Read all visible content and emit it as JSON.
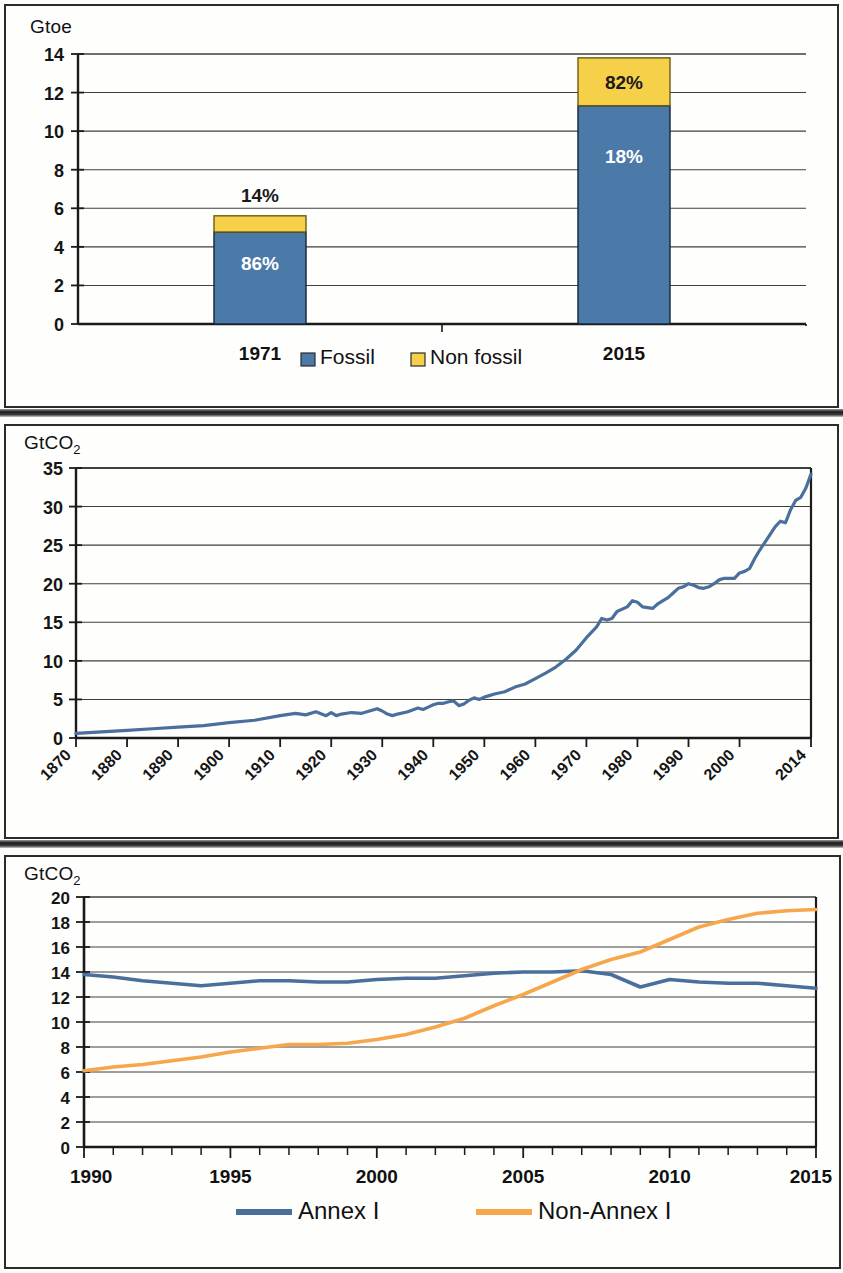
{
  "colors": {
    "fossil_blue": "#4b79a8",
    "non_fossil_yellow": "#f7d04a",
    "annex1_blue": "#4a6f9c",
    "non_annex1_orange": "#f6a64b",
    "axis": "#1a1a1a",
    "grid": "#3c3c3c",
    "panel_bg": "#fefefd",
    "panel_border": "#2b2b2b"
  },
  "panel1": {
    "unit_label": "Gtoe",
    "legend": [
      {
        "label": "Fossil",
        "color": "#4b79a8",
        "icon": "legend-swatch"
      },
      {
        "label": "Non fossil",
        "color": "#f7d04a",
        "icon": "legend-swatch"
      }
    ]
  },
  "panel2": {
    "unit_label_main": "GtCO",
    "unit_label_sub": "2"
  },
  "panel3": {
    "unit_label_main": "GtCO",
    "unit_label_sub": "2",
    "legend": [
      {
        "label": "Annex I",
        "color": "#4a6f9c",
        "icon": "legend-line"
      },
      {
        "label": "Non-Annex I",
        "color": "#f6a64b",
        "icon": "legend-line"
      }
    ]
  },
  "chart_data": [
    {
      "id": "world-primary-energy-supply",
      "type": "bar",
      "stacked": true,
      "title": "",
      "xlabel": "",
      "ylabel": "Gtoe",
      "ylim": [
        0,
        14
      ],
      "yticks": [
        0,
        2,
        4,
        6,
        8,
        10,
        12,
        14
      ],
      "grid": true,
      "legend_position": "bottom",
      "categories": [
        "1971",
        "2015"
      ],
      "series": [
        {
          "name": "Fossil",
          "color": "#4b79a8",
          "values": [
            4.77,
            11.32
          ],
          "data_labels": [
            "86%",
            "18%"
          ]
        },
        {
          "name": "Non fossil",
          "color": "#f7d04a",
          "values": [
            0.84,
            2.48
          ],
          "data_labels": [
            "14%",
            "82%"
          ]
        }
      ],
      "annotations": [
        {
          "text": "86%",
          "category": "1971",
          "series": "Fossil",
          "placement": "inside",
          "color": "#ffffff"
        },
        {
          "text": "14%",
          "category": "1971",
          "series": "Non fossil",
          "placement": "above",
          "color": "#1a1a1a"
        },
        {
          "text": "82%",
          "category": "2015",
          "series": "Fossil",
          "placement": "inside",
          "color": "#ffffff"
        },
        {
          "text": "18%",
          "category": "2015",
          "series": "Non fossil",
          "placement": "inside",
          "color": "#1a1a1a"
        }
      ],
      "totals": [
        5.61,
        13.8
      ]
    },
    {
      "id": "global-co2-emissions-1870-2014",
      "type": "line",
      "title": "",
      "xlabel": "",
      "ylabel": "GtCO2",
      "ylim": [
        0,
        35
      ],
      "yticks": [
        0,
        5,
        10,
        15,
        20,
        25,
        30,
        35
      ],
      "xlim": [
        1870,
        2014
      ],
      "xticks": [
        1870,
        1880,
        1890,
        1900,
        1910,
        1920,
        1930,
        1940,
        1950,
        1960,
        1970,
        1980,
        1990,
        2000,
        2014
      ],
      "xtick_rotation": -45,
      "grid": true,
      "legend_position": "none",
      "series": [
        {
          "name": "Global CO2 emissions",
          "color": "#4a6f9c",
          "x": [
            1870,
            1875,
            1880,
            1885,
            1890,
            1895,
            1900,
            1905,
            1910,
            1913,
            1915,
            1917,
            1919,
            1920,
            1921,
            1922,
            1924,
            1926,
            1928,
            1929,
            1930,
            1931,
            1932,
            1933,
            1935,
            1937,
            1938,
            1939,
            1940,
            1941,
            1942,
            1943,
            1944,
            1945,
            1946,
            1947,
            1948,
            1949,
            1950,
            1952,
            1954,
            1956,
            1958,
            1960,
            1962,
            1964,
            1966,
            1968,
            1970,
            1972,
            1973,
            1974,
            1975,
            1976,
            1978,
            1979,
            1980,
            1981,
            1982,
            1983,
            1984,
            1985,
            1986,
            1987,
            1988,
            1989,
            1990,
            1991,
            1992,
            1993,
            1994,
            1995,
            1996,
            1997,
            1998,
            1999,
            2000,
            2001,
            2002,
            2003,
            2004,
            2005,
            2006,
            2007,
            2008,
            2009,
            2010,
            2011,
            2012,
            2013,
            2014
          ],
          "y": [
            0.6,
            0.8,
            1.0,
            1.2,
            1.4,
            1.6,
            2.0,
            2.3,
            2.9,
            3.2,
            3.0,
            3.4,
            2.9,
            3.3,
            2.9,
            3.1,
            3.3,
            3.2,
            3.6,
            3.8,
            3.5,
            3.1,
            2.9,
            3.1,
            3.4,
            3.9,
            3.7,
            4.0,
            4.3,
            4.5,
            4.5,
            4.7,
            4.8,
            4.2,
            4.4,
            4.9,
            5.2,
            5.0,
            5.3,
            5.7,
            6.0,
            6.6,
            7.0,
            7.7,
            8.4,
            9.2,
            10.2,
            11.4,
            13.0,
            14.4,
            15.5,
            15.3,
            15.5,
            16.4,
            17.0,
            17.8,
            17.6,
            17.0,
            16.9,
            16.8,
            17.4,
            17.8,
            18.2,
            18.8,
            19.4,
            19.6,
            20.0,
            19.8,
            19.5,
            19.4,
            19.6,
            20.0,
            20.5,
            20.7,
            20.7,
            20.7,
            21.4,
            21.6,
            22.0,
            23.3,
            24.4,
            25.4,
            26.4,
            27.4,
            28.1,
            27.9,
            29.6,
            30.8,
            31.2,
            32.4,
            34.2
          ]
        }
      ]
    },
    {
      "id": "annex1-vs-non-annex1-co2",
      "type": "line",
      "title": "",
      "xlabel": "",
      "ylabel": "GtCO2",
      "ylim": [
        0,
        20
      ],
      "yticks": [
        0,
        2,
        4,
        6,
        8,
        10,
        12,
        14,
        16,
        18,
        20
      ],
      "xlim": [
        1990,
        2015
      ],
      "xticks": [
        1990,
        1995,
        2000,
        2005,
        2010,
        2015
      ],
      "xminorticks": [
        1991,
        1992,
        1993,
        1994,
        1996,
        1997,
        1998,
        1999,
        2001,
        2002,
        2003,
        2004,
        2006,
        2007,
        2008,
        2009,
        2011,
        2012,
        2013,
        2014
      ],
      "grid": true,
      "legend_position": "bottom",
      "x": [
        1990,
        1991,
        1992,
        1993,
        1994,
        1995,
        1996,
        1997,
        1998,
        1999,
        2000,
        2001,
        2002,
        2003,
        2004,
        2005,
        2006,
        2007,
        2008,
        2009,
        2010,
        2011,
        2012,
        2013,
        2014,
        2015
      ],
      "series": [
        {
          "name": "Annex I",
          "color": "#4a6f9c",
          "values": [
            13.8,
            13.6,
            13.3,
            13.1,
            12.9,
            13.1,
            13.3,
            13.3,
            13.2,
            13.2,
            13.4,
            13.5,
            13.5,
            13.7,
            13.9,
            14.0,
            14.0,
            14.1,
            13.8,
            12.8,
            13.4,
            13.2,
            13.1,
            13.1,
            12.9,
            12.7
          ]
        },
        {
          "name": "Non-Annex I",
          "color": "#f6a64b",
          "values": [
            6.1,
            6.4,
            6.6,
            6.9,
            7.2,
            7.6,
            7.9,
            8.2,
            8.2,
            8.3,
            8.6,
            9.0,
            9.6,
            10.3,
            11.3,
            12.2,
            13.2,
            14.2,
            15.0,
            15.6,
            16.6,
            17.6,
            18.2,
            18.7,
            18.9,
            19.0
          ]
        }
      ]
    }
  ]
}
